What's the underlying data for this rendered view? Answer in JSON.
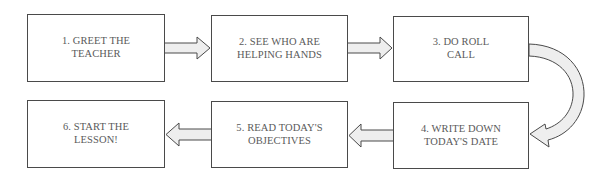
{
  "diagram": {
    "type": "flowchart",
    "direction": "snake: left-to-right top row, right-to-left bottom row",
    "colors": {
      "box_border": "#4a4a4a",
      "text": "#5a5a5a",
      "arrow_fill": "#eeeeee",
      "background": "#ffffff"
    },
    "steps": [
      {
        "id": 1,
        "label": "1. GREET THE\nTEACHER"
      },
      {
        "id": 2,
        "label": "2. SEE WHO ARE\nHELPING HANDS"
      },
      {
        "id": 3,
        "label": "3. DO ROLL\nCALL"
      },
      {
        "id": 4,
        "label": "4. WRITE DOWN\nTODAY'S DATE"
      },
      {
        "id": 5,
        "label": "5. READ TODAY'S\nOBJECTIVES"
      },
      {
        "id": 6,
        "label": "6. START THE\nLESSON!"
      }
    ],
    "connectors": [
      {
        "from": 1,
        "to": 2,
        "shape": "block-arrow-right"
      },
      {
        "from": 2,
        "to": 3,
        "shape": "block-arrow-right"
      },
      {
        "from": 3,
        "to": 4,
        "shape": "curved-u-turn-arrow"
      },
      {
        "from": 4,
        "to": 5,
        "shape": "block-arrow-left"
      },
      {
        "from": 5,
        "to": 6,
        "shape": "block-arrow-left"
      }
    ]
  }
}
